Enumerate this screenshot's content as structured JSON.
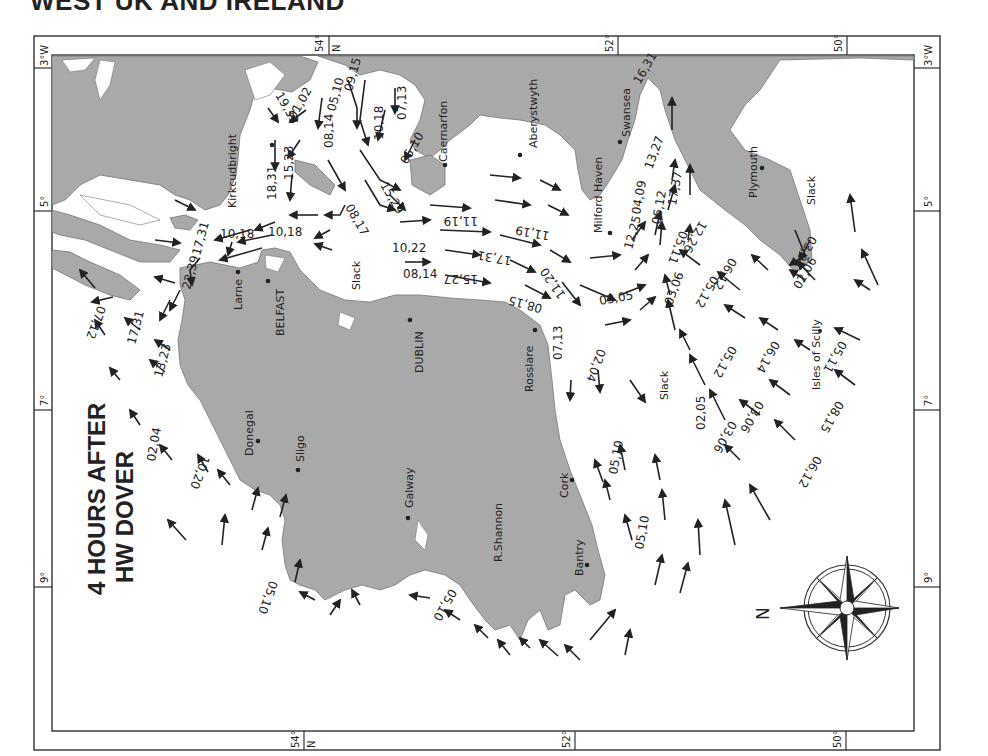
{
  "page": {
    "title": "WEST UK AND IRELAND",
    "panel_title_line1": "4 HOURS AFTER",
    "panel_title_line2": "HW DOVER"
  },
  "colors": {
    "land": "#a9a9a9",
    "sea": "#ffffff",
    "ink": "#222222",
    "frame": "#333333"
  },
  "frame": {
    "latitude_ticks": [
      {
        "label": "54°",
        "suffix": "N",
        "side": "top"
      },
      {
        "label": "52°",
        "side": "top"
      },
      {
        "label": "50°",
        "side": "top"
      },
      {
        "label": "54°",
        "suffix": "N",
        "side": "bottom"
      },
      {
        "label": "52°",
        "side": "bottom"
      },
      {
        "label": "50°",
        "side": "bottom"
      }
    ],
    "longitude_ticks": [
      {
        "label": "3°W",
        "side": "left"
      },
      {
        "label": "5°",
        "side": "left"
      },
      {
        "label": "7°",
        "side": "left"
      },
      {
        "label": "9°",
        "side": "left"
      },
      {
        "label": "3°W",
        "side": "right"
      },
      {
        "label": "5°",
        "side": "right"
      },
      {
        "label": "7°",
        "side": "right"
      },
      {
        "label": "9°",
        "side": "right"
      }
    ]
  },
  "places": {
    "kirkcudbright": "Kirkcudbright",
    "caernarfon": "Caernarfon",
    "aberystwyth": "Aberystwyth",
    "swansea": "Swansea",
    "milford_haven": "Milford Haven",
    "plymouth": "Plymouth",
    "larne": "Larne",
    "belfast": "BELFAST",
    "dublin": "DUBLIN",
    "rosslare": "Rosslare",
    "donegal": "Donegal",
    "sligo": "Sligo",
    "galway": "Galway",
    "shannon": "R.Shannon",
    "cork": "Cork",
    "bantry": "Bantry",
    "scilly": "Isles of Scilly"
  },
  "slack_labels": [
    "Slack",
    "Slack",
    "Slack"
  ],
  "tidal_rates": [
    "19,33",
    "01,02",
    "05,10",
    "09,15",
    "07,13",
    "10,18",
    "05,10",
    "08,14",
    "18,31",
    "15,23",
    "15,29",
    "08,17",
    "10,18",
    "10,18",
    "17,31",
    "22,39",
    "11,19",
    "11,19",
    "10,22",
    "17,31",
    "08,14",
    "15,27",
    "08,15",
    "11,20",
    "13,27",
    "16,31",
    "17,37",
    "04,09",
    "06,12",
    "12,25",
    "05,11",
    "12,26",
    "03,06",
    "03,05",
    "07,13",
    "02,04",
    "03,06",
    "05,12",
    "06,12",
    "02,06",
    "03,06",
    "05,11",
    "06,14",
    "05,12",
    "02,05",
    "03,06",
    "08,15",
    "06,12",
    "07,12",
    "17,31",
    "13,23",
    "02,04",
    "10,20",
    "05,10",
    "05,10",
    "05,10",
    "05,10"
  ],
  "compass": {
    "north_label": "N"
  }
}
